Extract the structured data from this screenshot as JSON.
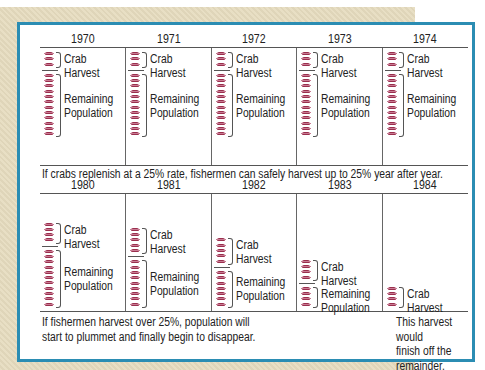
{
  "top_row": {
    "years": [
      "1970",
      "1971",
      "1972",
      "1973",
      "1974"
    ],
    "panels": [
      {
        "year": "1970",
        "harvest": 3,
        "remaining": 12
      },
      {
        "year": "1971",
        "harvest": 3,
        "remaining": 12
      },
      {
        "year": "1972",
        "harvest": 3,
        "remaining": 12
      },
      {
        "year": "1973",
        "harvest": 3,
        "remaining": 12
      },
      {
        "year": "1974",
        "harvest": 3,
        "remaining": 12
      }
    ],
    "caption": "If crabs replenish at a 25% rate, fishermen can safely harvest up to 25% year after year."
  },
  "bottom_row": {
    "years": [
      "1980",
      "1981",
      "1982",
      "1983",
      "1984"
    ],
    "panels": [
      {
        "year": "1980",
        "harvest": 4,
        "remaining": 11
      },
      {
        "year": "1981",
        "harvest": 5,
        "remaining": 9
      },
      {
        "year": "1982",
        "harvest": 5,
        "remaining": 7
      },
      {
        "year": "1983",
        "harvest": 4,
        "remaining": 4
      },
      {
        "year": "1984",
        "harvest": 4,
        "remaining": 0
      }
    ],
    "caption_left_line1": "If fishermen harvest over 25%, population will",
    "caption_left_line2": "start to plummet and finally begin to disappear.",
    "caption_right_line1": "This harvest would",
    "caption_right_line2": "finish off the",
    "caption_right_line3": "remainder."
  },
  "labels": {
    "harvest_line1": "Crab",
    "harvest_line2": "Harvest",
    "remaining_line1": "Remaining",
    "remaining_line2": "Population"
  },
  "colors": {
    "frame": "#2b8db3",
    "crab": "#9a2f4e",
    "background": "#e6dcbf"
  }
}
